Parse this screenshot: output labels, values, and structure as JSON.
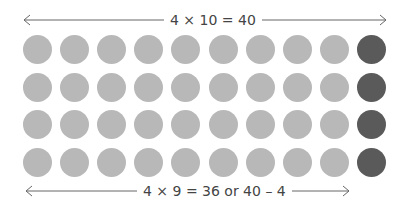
{
  "top_arrow": {
    "label": "4 × 10 = 40"
  },
  "bottom_arrow": {
    "label": "4 × 9 = 36  or  40 – 4"
  },
  "grid": {
    "rows": 4,
    "cols": 10,
    "dark_column": 10,
    "light_color": "#b8b8b8",
    "dark_color": "#5a5a5a"
  }
}
